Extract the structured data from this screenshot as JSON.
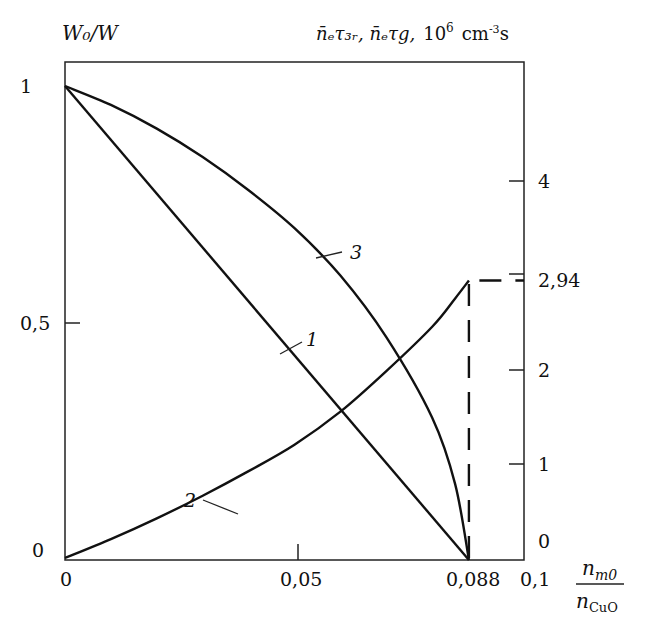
{
  "chart_data": {
    "type": "line",
    "title": "",
    "left_axis": {
      "label": "W0/W",
      "ticks": [
        0,
        0.5,
        1
      ],
      "tick_labels": [
        "0",
        "0,5",
        "1"
      ],
      "ylim": [
        0,
        1.05
      ]
    },
    "right_axis": {
      "label": "n̄eτ3r, n̄eτg, 10^6 cm^-3 s",
      "ticks": [
        0,
        1,
        2,
        2.94,
        4
      ],
      "tick_labels": [
        "0",
        "1",
        "2",
        "2,94",
        "4"
      ],
      "ylim": [
        0,
        5.2
      ]
    },
    "x_axis": {
      "label": "n_m0 / n_CuO",
      "ticks": [
        0,
        0.05,
        0.088,
        0.1
      ],
      "tick_labels": [
        "0",
        "0,05",
        "0,088",
        "0,1"
      ],
      "xlim": [
        0,
        0.1
      ]
    },
    "grid": false,
    "series": [
      {
        "name": "1",
        "axis": "left",
        "style": "solid",
        "x": [
          0,
          0.088
        ],
        "y": [
          1,
          0
        ]
      },
      {
        "name": "2",
        "axis": "right",
        "style": "solid",
        "x": [
          0,
          0.01,
          0.02,
          0.03,
          0.04,
          0.05,
          0.06,
          0.07,
          0.08,
          0.085,
          0.088
        ],
        "y": [
          0,
          0.2,
          0.42,
          0.66,
          0.92,
          1.2,
          1.55,
          1.98,
          2.45,
          2.75,
          2.94
        ]
      },
      {
        "name": "3",
        "axis": "left",
        "style": "solid",
        "x": [
          0,
          0.01,
          0.02,
          0.03,
          0.04,
          0.05,
          0.06,
          0.07,
          0.08,
          0.085,
          0.088
        ],
        "y": [
          1,
          0.96,
          0.91,
          0.85,
          0.78,
          0.7,
          0.6,
          0.47,
          0.3,
          0.16,
          0
        ]
      },
      {
        "name": "2 (limit)",
        "axis": "right",
        "style": "dashed",
        "x": [
          0.088,
          0.088,
          0.1
        ],
        "y": [
          0,
          2.94,
          2.94
        ]
      }
    ],
    "annotations": [
      "1",
      "2",
      "3",
      "2,94"
    ]
  },
  "labels": {
    "left_axis_title": "W₀/W",
    "right_axis_title_a": "n̄ₑτ₃ᵣ, n̄ₑτg,",
    "right_axis_title_b": "10",
    "right_axis_title_exp": "6",
    "right_axis_title_unit": "cm",
    "right_axis_title_unit_exp": "-3",
    "right_axis_title_s": "s",
    "x_axis_num": "n",
    "x_axis_num_sub": "m0",
    "x_axis_den": "n",
    "x_axis_den_sub": "CuO",
    "left_ticks": [
      "1",
      "0,5",
      "0"
    ],
    "right_ticks": [
      "4",
      "2,94",
      "2",
      "1",
      "0"
    ],
    "x_ticks": [
      "0",
      "0,05",
      "0,088",
      "0,1"
    ],
    "curve_labels": [
      "1",
      "2",
      "3"
    ]
  }
}
